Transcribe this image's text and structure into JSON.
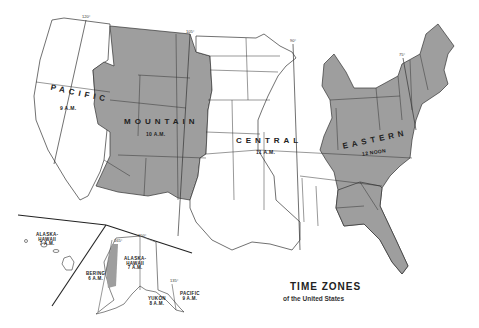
{
  "title": "TIME ZONES",
  "subtitle": "of the United States",
  "zones": [
    {
      "name": "PACIFIC",
      "time": "9 A.M."
    },
    {
      "name": "MOUNTAIN",
      "time": "10 A.M."
    },
    {
      "name": "CENTRAL",
      "time": "11 A.M."
    },
    {
      "name": "EASTERN",
      "time": "12 NOON"
    }
  ],
  "inset_zones": [
    {
      "name_line1": "ALASKA-",
      "name_line2": "HAWAII",
      "time": "7 A.M."
    },
    {
      "name_line1": "ALASKA-",
      "name_line2": "HAWAII",
      "time": "7 A.M."
    },
    {
      "name": "BERING",
      "time": "6 A.M."
    },
    {
      "name": "YUKON",
      "time": "8 A.M."
    },
    {
      "name": "PACIFIC",
      "time": "9 A.M."
    }
  ],
  "meridians": [
    "120°",
    "105°",
    "90°",
    "75°",
    "165°",
    "150°",
    "135°"
  ],
  "colors": {
    "shaded_zone": "#9e9e9e",
    "unshaded_zone": "#ffffff",
    "border": "#333333"
  }
}
